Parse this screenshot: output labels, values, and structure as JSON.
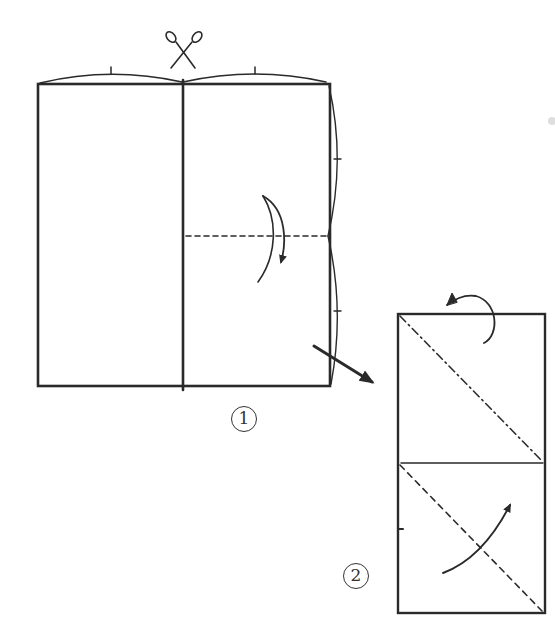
{
  "diagram": {
    "type": "origami-instructions",
    "colors": {
      "ink": "#2a2a2a",
      "paper": "#ffffff"
    },
    "steps": [
      {
        "number": "1",
        "label": "①",
        "elements": [
          {
            "kind": "rectangle",
            "desc": "paper sheet",
            "x": 38,
            "y": 84,
            "w": 292,
            "h": 302
          },
          {
            "kind": "solid-line",
            "desc": "vertical center cut line"
          },
          {
            "kind": "scissors-icon",
            "desc": "cut along center line"
          },
          {
            "kind": "equal-length-arcs",
            "desc": "top edge divided into two equal halves"
          },
          {
            "kind": "equal-length-arcs",
            "desc": "right edge divided into two equal halves"
          },
          {
            "kind": "valley-fold-line",
            "desc": "dashed horizontal fold at mid height of right half"
          },
          {
            "kind": "fold-arrow",
            "desc": "curved arrow indicating fold down"
          },
          {
            "kind": "next-step-arrow",
            "desc": "arrow pointing to step 2"
          }
        ]
      },
      {
        "number": "2",
        "label": "②",
        "elements": [
          {
            "kind": "rectangle",
            "desc": "folded strip",
            "x": 398,
            "y": 314,
            "w": 147,
            "h": 299
          },
          {
            "kind": "solid-line",
            "desc": "horizontal edge of folded layer"
          },
          {
            "kind": "mountain-fold-line",
            "desc": "dash-dot diagonal in top square"
          },
          {
            "kind": "fold-behind-arrow",
            "desc": "curled arrow at top indicating fold behind"
          },
          {
            "kind": "valley-fold-line",
            "desc": "dashed diagonal in bottom square"
          },
          {
            "kind": "fold-arrow",
            "desc": "curved arrow indicating fold up"
          }
        ]
      }
    ]
  }
}
